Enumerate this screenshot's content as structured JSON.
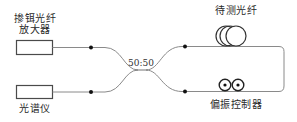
{
  "diagram": {
    "type": "fiber-optic-setup",
    "components": {
      "amplifier": {
        "label_line1": "掺铒光纤",
        "label_line2": "放大器"
      },
      "spectrometer": {
        "label": "光谱仪"
      },
      "coupler": {
        "ratio": "50:50"
      },
      "fiber_under_test": {
        "label": "待测光纤"
      },
      "polarization_controller": {
        "label": "偏振控制器"
      }
    },
    "colors": {
      "line": "#8a8a8a",
      "box": "#4a4a4a",
      "dot": "#111111",
      "text": "#2a2a2a"
    }
  }
}
